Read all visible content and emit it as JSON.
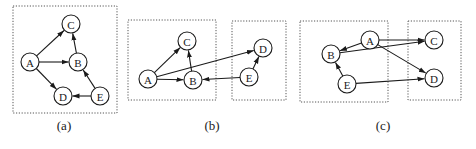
{
  "figure": {
    "node_radius": 9,
    "colors": {
      "stroke": "#1a1a1a",
      "box": "#555555",
      "background": "#ffffff"
    },
    "panels": [
      {
        "id": "a",
        "caption": "(a)",
        "caption_pos": [
          64,
          130
        ],
        "boxes": [
          {
            "x": 13,
            "y": 6,
            "w": 104,
            "h": 107
          }
        ],
        "nodes": [
          {
            "id": "A",
            "label": "A",
            "x": 30,
            "y": 62
          },
          {
            "id": "B",
            "label": "B",
            "x": 78,
            "y": 62
          },
          {
            "id": "C",
            "label": "C",
            "x": 71,
            "y": 24
          },
          {
            "id": "D",
            "label": "D",
            "x": 63,
            "y": 96
          },
          {
            "id": "E",
            "label": "E",
            "x": 100,
            "y": 96
          }
        ],
        "edges": [
          {
            "from": "A",
            "to": "C"
          },
          {
            "from": "A",
            "to": "B"
          },
          {
            "from": "A",
            "to": "D"
          },
          {
            "from": "B",
            "to": "C"
          },
          {
            "from": "E",
            "to": "B"
          },
          {
            "from": "E",
            "to": "D"
          }
        ]
      },
      {
        "id": "b",
        "caption": "(b)",
        "caption_pos": [
          212,
          130
        ],
        "boxes": [
          {
            "x": 128,
            "y": 20,
            "w": 88,
            "h": 80
          },
          {
            "x": 232,
            "y": 21,
            "w": 54,
            "h": 79
          }
        ],
        "nodes": [
          {
            "id": "A",
            "label": "A",
            "x": 148,
            "y": 79
          },
          {
            "id": "B",
            "label": "B",
            "x": 193,
            "y": 80
          },
          {
            "id": "C",
            "label": "C",
            "x": 187,
            "y": 41
          },
          {
            "id": "D",
            "label": "D",
            "x": 263,
            "y": 48
          },
          {
            "id": "E",
            "label": "E",
            "x": 249,
            "y": 77
          }
        ],
        "edges": [
          {
            "from": "A",
            "to": "C"
          },
          {
            "from": "A",
            "to": "B"
          },
          {
            "from": "A",
            "to": "D"
          },
          {
            "from": "B",
            "to": "C"
          },
          {
            "from": "E",
            "to": "B"
          },
          {
            "from": "E",
            "to": "D"
          }
        ]
      },
      {
        "id": "c",
        "caption": "(c)",
        "caption_pos": [
          383,
          130
        ],
        "boxes": [
          {
            "x": 300,
            "y": 21,
            "w": 88,
            "h": 81
          },
          {
            "x": 408,
            "y": 21,
            "w": 53,
            "h": 79
          }
        ],
        "nodes": [
          {
            "id": "A",
            "label": "A",
            "x": 370,
            "y": 40
          },
          {
            "id": "B",
            "label": "B",
            "x": 331,
            "y": 54
          },
          {
            "id": "C",
            "label": "C",
            "x": 434,
            "y": 40
          },
          {
            "id": "D",
            "label": "D",
            "x": 434,
            "y": 78
          },
          {
            "id": "E",
            "label": "E",
            "x": 347,
            "y": 84
          }
        ],
        "edges": [
          {
            "from": "A",
            "to": "B"
          },
          {
            "from": "A",
            "to": "C"
          },
          {
            "from": "A",
            "to": "D"
          },
          {
            "from": "B",
            "to": "C"
          },
          {
            "from": "E",
            "to": "B"
          },
          {
            "from": "E",
            "to": "D"
          }
        ]
      }
    ]
  }
}
